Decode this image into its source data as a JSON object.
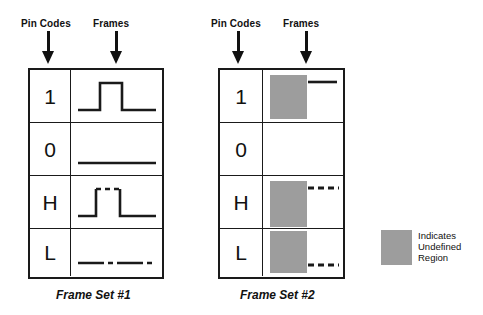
{
  "diagram": {
    "title_alt": "Pin code frame representations",
    "stroke_color": "#1a1a1a",
    "undefined_color": "#9d9d9d"
  },
  "frame_sets": [
    {
      "id": "frame-set-1",
      "caption": "Frame Set #1",
      "headers": {
        "pin_codes": "Pin Codes",
        "frames": "Frames"
      },
      "rows": [
        {
          "code": "1",
          "waveform": "solid-pulse-high",
          "line_style": "solid",
          "level": "pulse"
        },
        {
          "code": "0",
          "waveform": "solid-line-low",
          "line_style": "solid",
          "level": "low"
        },
        {
          "code": "H",
          "waveform": "pulse-dashed-top",
          "line_style": "mixed",
          "level": "pulse"
        },
        {
          "code": "L",
          "waveform": "dash-dot-line-low",
          "line_style": "dashdot",
          "level": "low"
        }
      ]
    },
    {
      "id": "frame-set-2",
      "caption": "Frame Set #2",
      "headers": {
        "pin_codes": "Pin Codes",
        "frames": "Frames"
      },
      "rows": [
        {
          "code": "1",
          "waveform": "undefined-box-solid-high",
          "line_style": "solid",
          "level": "high",
          "undefined_region": true
        },
        {
          "code": "0",
          "waveform": "empty",
          "line_style": "none",
          "level": "none",
          "undefined_region": false
        },
        {
          "code": "H",
          "waveform": "undefined-box-dashed-high",
          "line_style": "dashed",
          "level": "high",
          "undefined_region": true
        },
        {
          "code": "L",
          "waveform": "undefined-box-dashed-low",
          "line_style": "dashed",
          "level": "low",
          "undefined_region": true
        }
      ]
    }
  ],
  "legend": {
    "swatch_color": "#9d9d9d",
    "lines": [
      "Indicates",
      "Undefined",
      "Region"
    ],
    "text": "Indicates Undefined Region"
  },
  "icons": {
    "down_arrow": "down-arrow-icon"
  }
}
